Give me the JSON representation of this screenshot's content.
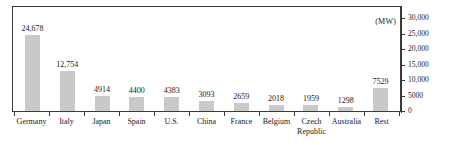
{
  "chart_data": {
    "type": "bar",
    "title": "",
    "subtitle": "",
    "xlabel": "",
    "ylabel": "",
    "unit_label": "(MW)",
    "categories": [
      "Germany",
      "Italy",
      "Japan",
      "Spain",
      "U.S.",
      "China",
      "France",
      "Belgium",
      "Czech Republic",
      "Australia",
      "Rest"
    ],
    "category_lines": [
      [
        "Germany"
      ],
      [
        "Italy"
      ],
      [
        "Japan"
      ],
      [
        "Spain"
      ],
      [
        "U.S."
      ],
      [
        "China"
      ],
      [
        "France"
      ],
      [
        "Belgium"
      ],
      [
        "Czech",
        "Republic"
      ],
      [
        "Australia"
      ],
      [
        "Rest"
      ]
    ],
    "values": [
      24678,
      12754,
      4914,
      4400,
      4383,
      3093,
      2659,
      2018,
      1959,
      1298,
      7529
    ],
    "data_labels": [
      "24,678",
      "12,754",
      "4914",
      "4400",
      "4383",
      "3093",
      "2659",
      "2018",
      "1959",
      "1298",
      "7529"
    ],
    "ylim": [
      0,
      30000
    ],
    "y_ticks": [
      0,
      5000,
      10000,
      15000,
      20000,
      25000,
      30000
    ],
    "y_tick_labels": [
      "0",
      "5000",
      "10,000",
      "15,000",
      "20,000",
      "25,000",
      "30,000"
    ],
    "y_axis_position": "right",
    "grid": false,
    "legend": null,
    "bar_color": "#c9c9c9",
    "axis_color": "#3a3a3a",
    "text_color": "#1a1a1a",
    "background": "#ffffff"
  }
}
